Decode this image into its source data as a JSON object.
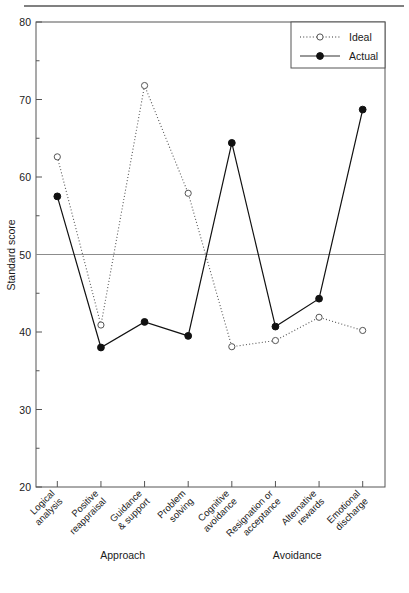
{
  "figure": {
    "has_top_rule": true,
    "background": "#ffffff",
    "foreground": "#1a1a1a"
  },
  "chart_data": {
    "type": "line",
    "title": "",
    "xlabel": "",
    "ylabel": "Standard score",
    "ylim": [
      20,
      80
    ],
    "y_ticks": [
      20,
      30,
      40,
      50,
      60,
      70,
      80
    ],
    "y_minor_ticks": [
      25,
      35,
      45,
      55,
      65,
      75
    ],
    "grid": false,
    "legend_position": "top-right",
    "categories": [
      "Logical analysis",
      "Positive reappraisal",
      "Guidance & support",
      "Problem solving",
      "Cognitive avoidance",
      "Resignation or acceptance",
      "Alternative rewards",
      "Emotional discharge"
    ],
    "category_lines": [
      [
        "Logical",
        "analysis"
      ],
      [
        "Positive",
        "reappraisal"
      ],
      [
        "Guidance",
        "& support"
      ],
      [
        "Problem",
        "solving"
      ],
      [
        "Cognitive",
        "avoidance"
      ],
      [
        "Resignation or",
        "acceptance"
      ],
      [
        "Alternative",
        "rewards"
      ],
      [
        "Emotional",
        "discharge"
      ]
    ],
    "groups": [
      {
        "label": "Approach",
        "categories": [
          0,
          1,
          2,
          3
        ]
      },
      {
        "label": "Avoidance",
        "categories": [
          4,
          5,
          6,
          7
        ]
      }
    ],
    "series": [
      {
        "name": "Ideal",
        "style": "dotted",
        "marker": "open-circle",
        "color": "#555555",
        "values": [
          62.6,
          40.9,
          71.8,
          57.9,
          38.1,
          38.9,
          41.9,
          40.2
        ]
      },
      {
        "name": "Actual",
        "style": "solid",
        "marker": "filled-circle",
        "color": "#111111",
        "values": [
          57.5,
          38.0,
          41.3,
          39.5,
          64.4,
          40.7,
          44.3,
          68.7
        ]
      }
    ],
    "reference_line": {
      "value": 50,
      "color": "#8c8c8c",
      "orientation": "horizontal"
    },
    "annotations": []
  },
  "legend": {
    "items": [
      {
        "label": "Ideal",
        "marker": "open-circle",
        "style": "dotted"
      },
      {
        "label": "Actual",
        "marker": "filled-circle",
        "style": "solid"
      }
    ]
  }
}
